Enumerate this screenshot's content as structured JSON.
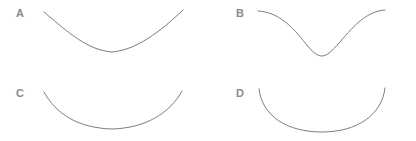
{
  "figure": {
    "background_color": "#ffffff",
    "stroke_color": "#7d7d7d",
    "label_color": "#8a8a8a",
    "stroke_width": 1,
    "width": 416,
    "height": 141
  },
  "panels": [
    {
      "id": "a",
      "label": "A",
      "label_x": 16,
      "label_y": 8,
      "description": "shallow-parabola",
      "path": "M 44 12 C 70 34, 88 50, 112 52 C 136 50, 160 32, 183 10"
    },
    {
      "id": "b",
      "label": "B",
      "label_x": 236,
      "label_y": 8,
      "description": "gaussian-well-flat-tails",
      "path": "M 258 11 C 278 12, 292 26, 306 44 C 313 53, 318 56, 322 56 C 327 56, 332 51, 340 42 C 355 24, 368 11, 385 10"
    },
    {
      "id": "c",
      "label": "C",
      "label_x": 16,
      "label_y": 88,
      "description": "deep-u-broad-bottom",
      "path": "M 44 92 C 56 114, 78 128, 112 129 C 146 128, 170 113, 182 91"
    },
    {
      "id": "d",
      "label": "D",
      "label_x": 236,
      "label_y": 88,
      "description": "semicircular-arc",
      "path": "M 259 89 C 262 116, 287 132, 322 132 C 357 132, 382 115, 385 88"
    }
  ],
  "chart_data": {
    "type": "line",
    "title": "",
    "xlabel": "",
    "ylabel": "",
    "grid": false,
    "legend": "none",
    "axis_visible": false,
    "note": "Four unlabeled downward-opening (concave-up) curves shown in a 2x2 arrangement, each marked with a letter. No axes, ticks or numeric values are printed in the image.",
    "xlim": [
      0,
      1
    ],
    "ylim": [
      0,
      1
    ],
    "series": [
      {
        "name": "A",
        "shape": "shallow parabola, gentle concave-up, moderate slope at ends",
        "x": [
          0,
          0.1,
          0.2,
          0.3,
          0.4,
          0.5,
          0.6,
          0.7,
          0.8,
          0.9,
          1
        ],
        "values": [
          1,
          0.74,
          0.52,
          0.34,
          0.22,
          0.15,
          0.19,
          0.3,
          0.47,
          0.7,
          1
        ]
      },
      {
        "name": "B",
        "shape": "gaussian well / sigmoid pair, flat tails with narrow deep trough",
        "x": [
          0,
          0.1,
          0.2,
          0.3,
          0.4,
          0.5,
          0.6,
          0.7,
          0.8,
          0.9,
          1
        ],
        "values": [
          1,
          0.97,
          0.89,
          0.69,
          0.38,
          0.13,
          0.1,
          0.3,
          0.62,
          0.87,
          1
        ]
      },
      {
        "name": "C",
        "shape": "deep U, broad flat bottom with steeper sides",
        "x": [
          0,
          0.1,
          0.2,
          0.3,
          0.4,
          0.5,
          0.6,
          0.7,
          0.8,
          0.9,
          1
        ],
        "values": [
          1,
          0.66,
          0.4,
          0.2,
          0.09,
          0.05,
          0.07,
          0.16,
          0.35,
          0.63,
          1
        ]
      },
      {
        "name": "D",
        "shape": "near-semicircular arc, almost vertical at the ends, flat bottom",
        "x": [
          0,
          0.1,
          0.2,
          0.3,
          0.4,
          0.5,
          0.6,
          0.7,
          0.8,
          0.9,
          1
        ],
        "values": [
          1,
          0.52,
          0.27,
          0.12,
          0.04,
          0.02,
          0.03,
          0.09,
          0.22,
          0.48,
          1
        ]
      }
    ]
  }
}
